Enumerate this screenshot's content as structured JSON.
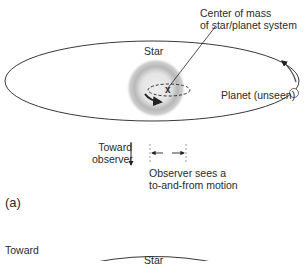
{
  "panel_a": {
    "label": "(a)",
    "center_of_mass": {
      "line1": "Center of mass",
      "line2": "of star/planet system",
      "marker": "x"
    },
    "star_label": "Star",
    "planet_label": "Planet (unseen)",
    "toward_observer": {
      "line1": "Toward",
      "line2": "observer"
    },
    "observer_sees": {
      "line1": "Observer sees a",
      "line2": "to-and-from motion"
    }
  },
  "panel_b": {
    "toward_label": "Toward",
    "star_label": "Star"
  },
  "colors": {
    "line": "#222222",
    "star_glow": "#9a9a9a",
    "star_core": "#e6e6e6",
    "background": "#ffffff"
  }
}
